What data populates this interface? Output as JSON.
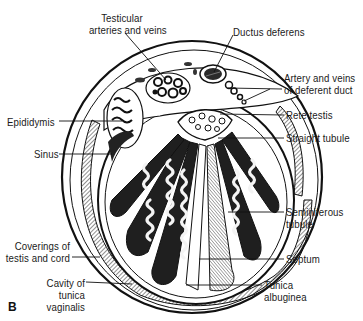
{
  "figure": {
    "panel_letter": "B"
  },
  "labels": {
    "testicular_arteries": "Testicular\narteries and veins",
    "ductus_deferens": "Ductus deferens",
    "artery_deferent": "Artery and veins\nof deferent duct",
    "epididymis": "Epididymis",
    "rete_testis": "Rete testis",
    "sinus": "Sinus",
    "straight_tubule": "Straight tubule",
    "seminiferous_tubule": "Seminiferous\ntubule",
    "coverings": "Coverings of\ntestis and cord",
    "septum": "Septum",
    "cavity": "Cavity of\ntunica\nvaginalis",
    "tunica_albuginea": "Tunica\nalbuginea"
  },
  "colors": {
    "ink": "#1a1a1a",
    "fill_dark": "#2a2a2a",
    "paper": "#ffffff",
    "tubule_light": "#f4f4f4"
  }
}
